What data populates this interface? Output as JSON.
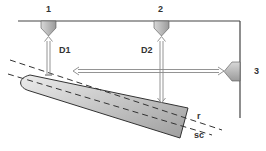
{
  "diagram": {
    "type": "measurement-setup",
    "sensors": [
      {
        "id": "1",
        "label": "1"
      },
      {
        "id": "2",
        "label": "2"
      },
      {
        "id": "3",
        "label": "3"
      }
    ],
    "distances": [
      {
        "id": "D1",
        "label": "D1"
      },
      {
        "id": "D2",
        "label": "D2"
      }
    ],
    "lines": [
      {
        "id": "r",
        "label": "r",
        "style": "dashed"
      },
      {
        "id": "sc",
        "label": "sc",
        "style": "dashed"
      }
    ],
    "colors": {
      "frame": "#444444",
      "body_fill_light": "#e4e4e4",
      "body_fill_dark": "#a8a8a8",
      "sensor_fill": "#b8b8b8",
      "arrow": "#9a9a9a",
      "text": "#333333"
    }
  }
}
